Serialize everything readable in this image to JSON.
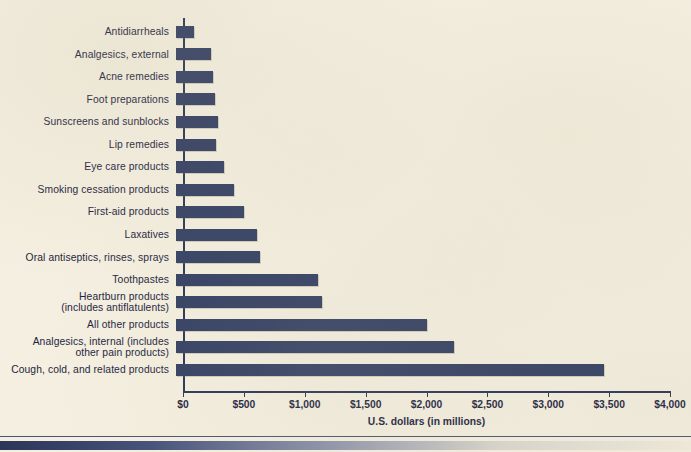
{
  "chart_data": {
    "type": "bar",
    "orientation": "horizontal",
    "title": "",
    "subtitle": "",
    "xlabel": "U.S. dollars (in millions)",
    "ylabel": "",
    "xlim": [
      0,
      4000
    ],
    "xtick_labels": [
      "$0",
      "$500",
      "$1,000",
      "$1,500",
      "$2,000",
      "$2,500",
      "$3,000",
      "$3,500",
      "$4,000"
    ],
    "xtick_values": [
      0,
      500,
      1000,
      1500,
      2000,
      2500,
      3000,
      3500,
      4000
    ],
    "grid": false,
    "legend": null,
    "bar_color": "#333f63",
    "background_color": "#f4efe0",
    "categories": [
      "Antidiarrheals",
      "Analgesics, external",
      "Acne remedies",
      "Foot preparations",
      "Sunscreens and sunblocks",
      "Lip remedies",
      "Eye care products",
      "Smoking cessation products",
      "First-aid products",
      "Laxatives",
      "Oral antiseptics, rinses, sprays",
      "Toothpastes",
      "Heartburn products\n(includes antiflatulents)",
      "All other products",
      "Analgesics, internal (includes\nother pain products)",
      "Cough, cold, and related products"
    ],
    "values": [
      150,
      290,
      300,
      320,
      345,
      330,
      395,
      475,
      560,
      665,
      690,
      1165,
      1200,
      2060,
      2280,
      3515
    ]
  },
  "footer": {
    "rule": "",
    "accent_bar": ""
  }
}
